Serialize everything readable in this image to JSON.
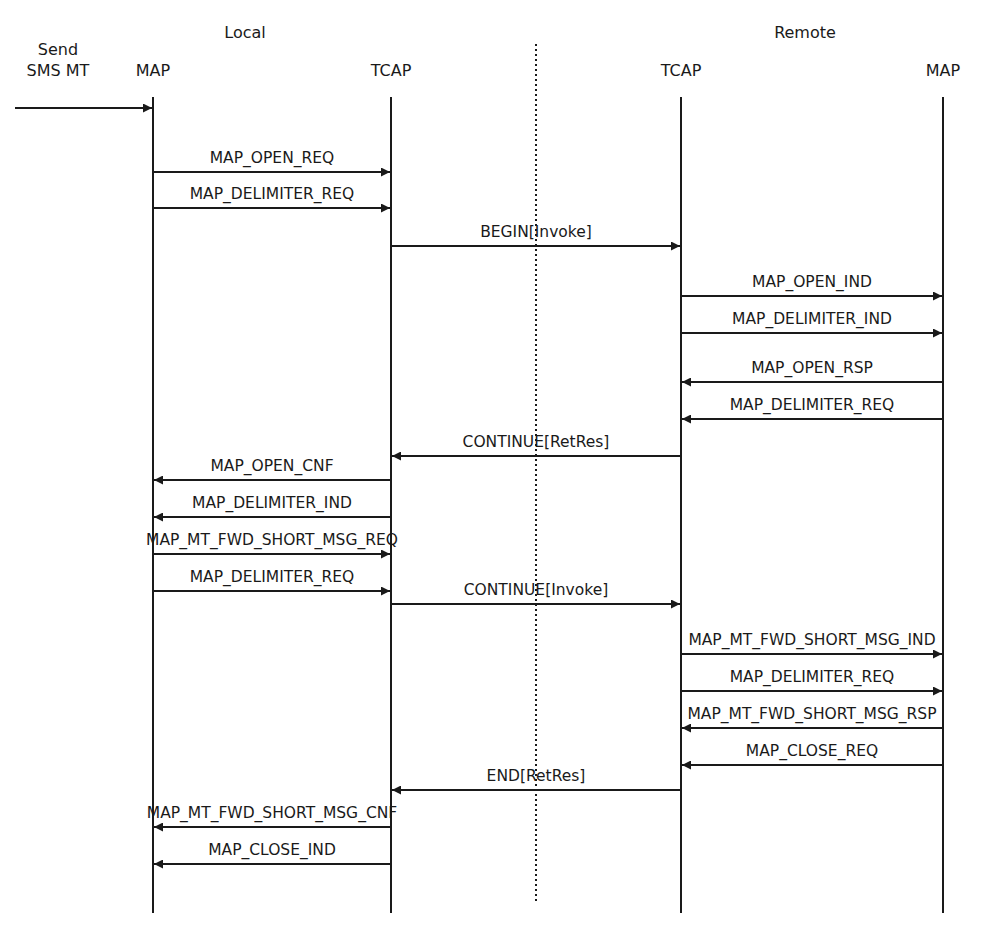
{
  "diagram": {
    "type": "sequence",
    "title": "Send SMS MT",
    "groups": [
      {
        "label": "Local",
        "x": 245,
        "y": 38
      },
      {
        "label": "Remote",
        "x": 805,
        "y": 38
      }
    ],
    "trigger": {
      "line1": "Send",
      "line2": "SMS MT",
      "x": 58,
      "from_x": 15,
      "to_x": 153,
      "y": 108
    },
    "participants": [
      {
        "id": "local_map",
        "label": "MAP",
        "x": 153
      },
      {
        "id": "local_tcap",
        "label": "TCAP",
        "x": 391
      },
      {
        "id": "remote_tcap",
        "label": "TCAP",
        "x": 681
      },
      {
        "id": "remote_map",
        "label": "MAP",
        "x": 943
      }
    ],
    "lifeline_top": 97,
    "lifeline_bottom": 913,
    "divider": {
      "x": 536,
      "top": 44,
      "bottom": 901,
      "style": "dotted"
    },
    "messages": [
      {
        "label": "MAP_OPEN_REQ",
        "from": "local_map",
        "to": "local_tcap",
        "y": 172
      },
      {
        "label": "MAP_DELIMITER_REQ",
        "from": "local_map",
        "to": "local_tcap",
        "y": 208
      },
      {
        "label": "BEGIN[Invoke]",
        "from": "local_tcap",
        "to": "remote_tcap",
        "y": 246
      },
      {
        "label": "MAP_OPEN_IND",
        "from": "remote_tcap",
        "to": "remote_map",
        "y": 296
      },
      {
        "label": "MAP_DELIMITER_IND",
        "from": "remote_tcap",
        "to": "remote_map",
        "y": 333
      },
      {
        "label": "MAP_OPEN_RSP",
        "from": "remote_map",
        "to": "remote_tcap",
        "y": 382
      },
      {
        "label": "MAP_DELIMITER_REQ",
        "from": "remote_map",
        "to": "remote_tcap",
        "y": 419
      },
      {
        "label": "CONTINUE[RetRes]",
        "from": "remote_tcap",
        "to": "local_tcap",
        "y": 456
      },
      {
        "label": "MAP_OPEN_CNF",
        "from": "local_tcap",
        "to": "local_map",
        "y": 480
      },
      {
        "label": "MAP_DELIMITER_IND",
        "from": "local_tcap",
        "to": "local_map",
        "y": 517
      },
      {
        "label": "MAP_MT_FWD_SHORT_MSG_REQ",
        "from": "local_map",
        "to": "local_tcap",
        "y": 554
      },
      {
        "label": "MAP_DELIMITER_REQ",
        "from": "local_map",
        "to": "local_tcap",
        "y": 591
      },
      {
        "label": "CONTINUE[Invoke]",
        "from": "local_tcap",
        "to": "remote_tcap",
        "y": 604
      },
      {
        "label": "MAP_MT_FWD_SHORT_MSG_IND",
        "from": "remote_tcap",
        "to": "remote_map",
        "y": 654
      },
      {
        "label": "MAP_DELIMITER_REQ",
        "from": "remote_tcap",
        "to": "remote_map",
        "y": 691
      },
      {
        "label": "MAP_MT_FWD_SHORT_MSG_RSP",
        "from": "remote_map",
        "to": "remote_tcap",
        "y": 728
      },
      {
        "label": "MAP_CLOSE_REQ",
        "from": "remote_map",
        "to": "remote_tcap",
        "y": 765
      },
      {
        "label": "END[RetRes]",
        "from": "remote_tcap",
        "to": "local_tcap",
        "y": 790
      },
      {
        "label": "MAP_MT_FWD_SHORT_MSG_CNF",
        "from": "local_tcap",
        "to": "local_map",
        "y": 827
      },
      {
        "label": "MAP_CLOSE_IND",
        "from": "local_tcap",
        "to": "local_map",
        "y": 864
      }
    ],
    "colors": {
      "line": "#1a1a1a",
      "text": "#1a1a1a",
      "background": "#ffffff"
    }
  }
}
